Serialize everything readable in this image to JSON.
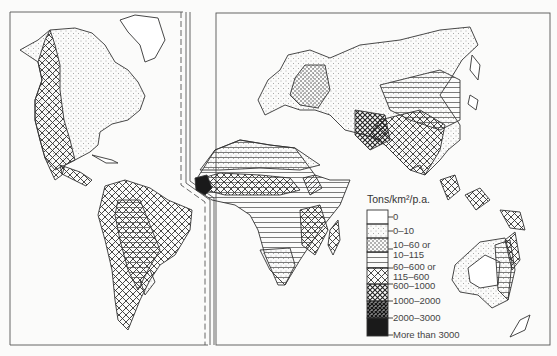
{
  "figure": {
    "type": "world map",
    "panels": [
      "Americas",
      "Eurasia-Africa-Australia"
    ]
  },
  "legend": {
    "title": "Tons/km²/p.a.",
    "classes": [
      {
        "label": "0",
        "pattern": "blank"
      },
      {
        "label": "0–10",
        "pattern": "fine-dots"
      },
      {
        "label": "10–60 or",
        "label2": "10–115",
        "pattern": "coarse-dots"
      },
      {
        "label": "60–600 or",
        "label2": "115–600",
        "pattern": "horizontal-lines"
      },
      {
        "label": "600–1000",
        "pattern": "open-crosshatch"
      },
      {
        "label": "1000–2000",
        "pattern": "dense-crosshatch"
      },
      {
        "label": "2000–3000",
        "pattern": "very-dense-crosshatch"
      },
      {
        "label": "More than 3000",
        "pattern": "solid-black"
      }
    ]
  },
  "regions": [
    {
      "name": "North America west",
      "class": "600–1000"
    },
    {
      "name": "North America north/east",
      "class": "0–10"
    },
    {
      "name": "South America Andes/margins",
      "class": "600–1000"
    },
    {
      "name": "South America interior",
      "class": "60–600 or 115–600"
    },
    {
      "name": "Europe",
      "class": "10–60 or 10–115"
    },
    {
      "name": "Siberia",
      "class": "0–10"
    },
    {
      "name": "Sahara/Arabia",
      "class": "0–10"
    },
    {
      "name": "Sahel belt",
      "class": "600–1000"
    },
    {
      "name": "West Africa coast",
      "class": "More than 3000"
    },
    {
      "name": "Central/Southern Africa",
      "class": "60–600 or 115–600"
    },
    {
      "name": "East Africa highlands",
      "class": "600–1000"
    },
    {
      "name": "China",
      "class": "60–600 or 115–600"
    },
    {
      "name": "South/Southeast Asia",
      "class": "600–1000"
    },
    {
      "name": "Australia interior",
      "class": "0"
    },
    {
      "name": "Australia margins",
      "class": "10–60 or 10–115"
    }
  ],
  "colors": {
    "ink": "#2a2a2a",
    "paper": "#fbfbfa",
    "solid": "#1a1a1a"
  }
}
